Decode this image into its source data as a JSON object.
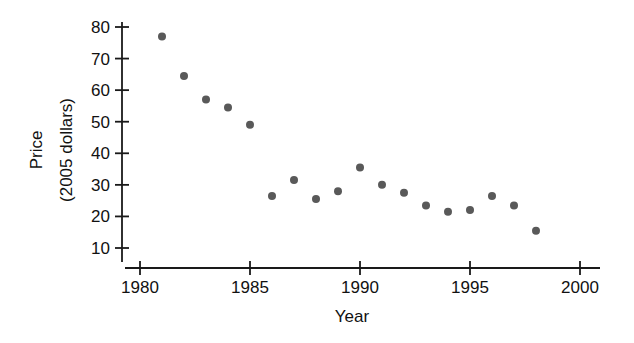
{
  "chart_data": {
    "type": "scatter",
    "title": "",
    "subtitle": "",
    "xlabel": "Year",
    "ylabel": "Price\n(2005 dollars)",
    "ylabel_line1": "Price",
    "ylabel_line2": "(2005 dollars)",
    "xlim": [
      1980,
      2000
    ],
    "ylim": [
      5,
      83
    ],
    "xticks": [
      1980,
      1985,
      1990,
      1995,
      2000
    ],
    "xtick_labels": [
      "1980",
      "1985",
      "1990",
      "1995",
      "2000"
    ],
    "yticks": [
      10,
      20,
      30,
      40,
      50,
      60,
      70,
      80
    ],
    "ytick_labels": [
      "10",
      "20",
      "30",
      "40",
      "50",
      "60",
      "70",
      "80"
    ],
    "grid": false,
    "legend": false,
    "legend_position": "none",
    "marker": "circle",
    "marker_color": "#595959",
    "marker_size": 8,
    "x": [
      1981,
      1982,
      1983,
      1984,
      1985,
      1986,
      1987,
      1988,
      1989,
      1990,
      1991,
      1992,
      1993,
      1994,
      1995,
      1996,
      1997,
      1998
    ],
    "y": [
      77,
      64.5,
      57,
      54.5,
      49,
      26.5,
      31.5,
      25.5,
      28,
      35.5,
      30,
      27.5,
      23.5,
      21.5,
      22,
      26.5,
      23.5,
      15.5
    ],
    "points": [
      {
        "x": 1981,
        "y": 77
      },
      {
        "x": 1982,
        "y": 64.5
      },
      {
        "x": 1983,
        "y": 57
      },
      {
        "x": 1984,
        "y": 54.5
      },
      {
        "x": 1985,
        "y": 49
      },
      {
        "x": 1986,
        "y": 26.5
      },
      {
        "x": 1987,
        "y": 31.5
      },
      {
        "x": 1988,
        "y": 25.5
      },
      {
        "x": 1989,
        "y": 28
      },
      {
        "x": 1990,
        "y": 35.5
      },
      {
        "x": 1991,
        "y": 30
      },
      {
        "x": 1992,
        "y": 27.5
      },
      {
        "x": 1993,
        "y": 23.5
      },
      {
        "x": 1994,
        "y": 21.5
      },
      {
        "x": 1995,
        "y": 22
      },
      {
        "x": 1996,
        "y": 26.5
      },
      {
        "x": 1997,
        "y": 23.5
      },
      {
        "x": 1998,
        "y": 15.5
      }
    ]
  },
  "colors": {
    "background": "#ffffff",
    "axis": "#1a1a1a",
    "text": "#111111",
    "marker": "#595959"
  }
}
